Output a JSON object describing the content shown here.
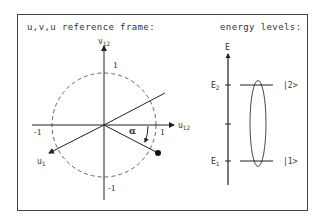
{
  "diagram": {
    "frame": {
      "color": "#444444"
    },
    "left_panel": {
      "title": "u,v,u reference frame:",
      "axes": {
        "vertical_label": "v",
        "vertical_label_sub": "12",
        "horizontal_label": "u",
        "horizontal_label_sub": "12",
        "diagonal_label": "u",
        "diagonal_label_sub": "1"
      },
      "tick_labels": {
        "top": "1",
        "bottom": "-1",
        "left": "-1",
        "right": "1"
      },
      "angle_label": "α",
      "circle_style": "dashed unit circle"
    },
    "right_panel": {
      "title": "energy levels:",
      "axis_label": "E",
      "levels": [
        {
          "label": "E",
          "label_sub": "2",
          "state": "|2>"
        },
        {
          "label": "E",
          "label_sub": "1",
          "state": "|1>"
        }
      ]
    }
  }
}
